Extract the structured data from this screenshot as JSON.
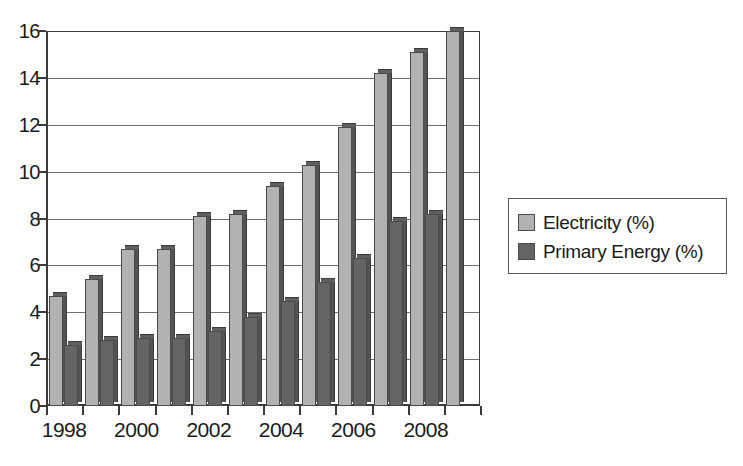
{
  "chart_data": {
    "type": "bar",
    "title": "",
    "subtitle": "",
    "xlabel": "",
    "ylabel": "",
    "grid": true,
    "legend_position": "right",
    "ylim": [
      0,
      16
    ],
    "ytick_step": 2,
    "yticks": [
      "0",
      "2",
      "4",
      "6",
      "8",
      "10",
      "12",
      "14",
      "16"
    ],
    "categories": [
      "1998",
      "1999",
      "2000",
      "2001",
      "2002",
      "2003",
      "2004",
      "2005",
      "2006",
      "2007",
      "2008",
      "2009"
    ],
    "xtick_labels": [
      "1998",
      "",
      "2000",
      "",
      "2002",
      "",
      "2004",
      "",
      "2006",
      "",
      "2008",
      ""
    ],
    "series": [
      {
        "name": "Electricity (%)",
        "color": "#b2b2b2",
        "values": [
          4.7,
          5.4,
          6.7,
          6.7,
          8.1,
          8.2,
          9.4,
          10.3,
          11.9,
          14.2,
          15.1,
          16.0
        ]
      },
      {
        "name": "Primary Energy (%)",
        "color": "#646464",
        "values": [
          2.6,
          2.8,
          2.9,
          2.9,
          3.2,
          3.8,
          4.5,
          5.3,
          6.3,
          7.9,
          8.2,
          null
        ]
      }
    ]
  },
  "legend": {
    "items": [
      {
        "label": "Electricity (%)",
        "color": "#b2b2b2"
      },
      {
        "label": "Primary Energy (%)",
        "color": "#646464"
      }
    ]
  },
  "colors": {
    "axis": "#3b3b3b",
    "grid": "#6e6e6e",
    "electricity": "#b2b2b2",
    "primary_energy": "#646464",
    "background": "#ffffff"
  }
}
